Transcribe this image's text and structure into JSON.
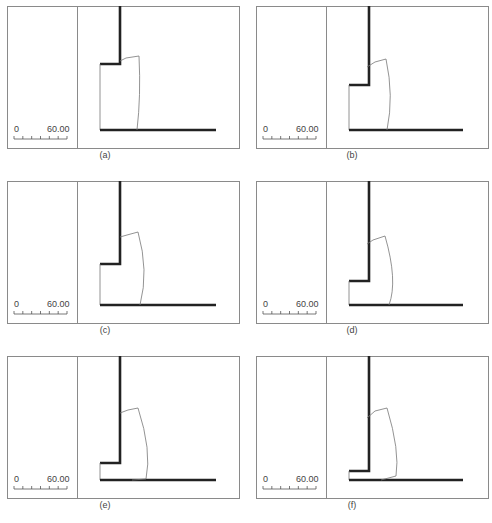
{
  "figure": {
    "panels": [
      {
        "id": "a",
        "caption": "(a)",
        "x": 7,
        "y": 6,
        "capx": 105,
        "capy": 155
      },
      {
        "id": "b",
        "caption": "(b)",
        "x": 256,
        "y": 6,
        "capx": 352,
        "capy": 155
      },
      {
        "id": "c",
        "caption": "(c)",
        "x": 7,
        "y": 181,
        "capx": 105,
        "capy": 330
      },
      {
        "id": "d",
        "caption": "(d)",
        "x": 256,
        "y": 181,
        "capx": 352,
        "capy": 330
      },
      {
        "id": "e",
        "caption": "(e)",
        "x": 7,
        "y": 356,
        "capx": 105,
        "capy": 505
      },
      {
        "id": "f",
        "caption": "(f)",
        "x": 256,
        "y": 356,
        "capx": 352,
        "capy": 505
      }
    ],
    "scale_bar": {
      "start_label": "0",
      "end_label": "60.00"
    },
    "colors": {
      "frame": "#8a8a8a",
      "wall": "#222222",
      "outline": "#777777"
    }
  },
  "shapes": {
    "a": {
      "step_y": 58,
      "wedge": "M113,55 L119,52 L132,50 Q134,90 130,124",
      "ground_end": 209
    },
    "b": {
      "step_y": 79,
      "wedge": "M111,61 L119,56 L130,53 Q138,90 131,124",
      "ground_end": 207
    },
    "c": {
      "step_y": 83,
      "wedge": "M113,56 L120,54 L131,51 Q142,90 133,124",
      "ground_end": 209
    },
    "d": {
      "step_y": 100,
      "wedge": "M111,63 L117,59 L129,55 Q142,100 133,124",
      "ground_end": 207
    },
    "e": {
      "step_y": 107,
      "wedge": "M113,57 L121,54 L131,52 Q145,95 139,123 L125,124",
      "ground_end": 209
    },
    "f": {
      "step_y": 115,
      "wedge": "M111,62 L119,55 L131,52 Q144,95 140,120 L125,124",
      "ground_end": 207
    }
  }
}
